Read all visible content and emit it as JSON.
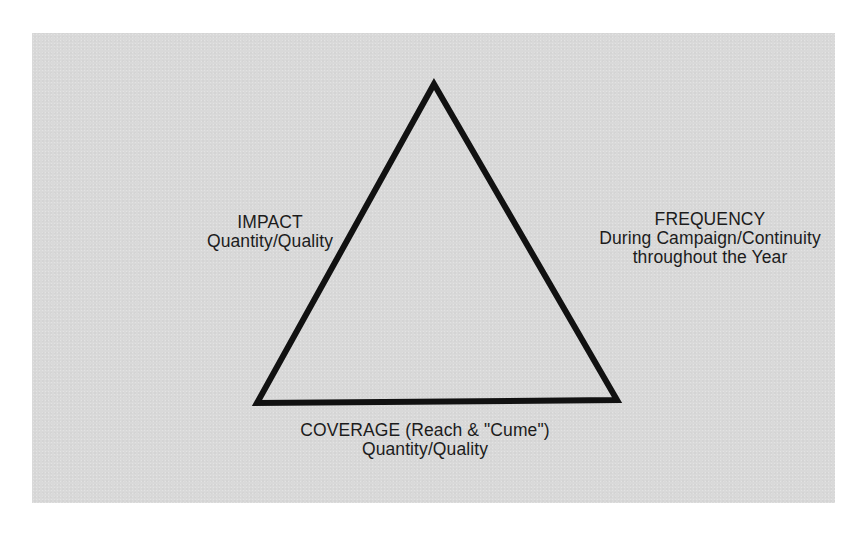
{
  "diagram": {
    "type": "triangle",
    "colors": {
      "background": "#ffffff",
      "panel": "#d9d9d9",
      "stroke": "#111111",
      "text": "#1c1c1c"
    },
    "vertices": {
      "apex": [
        434,
        84
      ],
      "bottom_left": [
        257,
        403
      ],
      "bottom_right": [
        617,
        400
      ]
    },
    "labels": {
      "impact": {
        "title": "IMPACT",
        "subtitle": "Quantity/Quality"
      },
      "frequency": {
        "title": "FREQUENCY",
        "line2": "During Campaign/Continuity",
        "line3": "throughout the Year"
      },
      "coverage": {
        "title": "COVERAGE (Reach & \"Cume\")",
        "subtitle": "Quantity/Quality"
      }
    }
  }
}
